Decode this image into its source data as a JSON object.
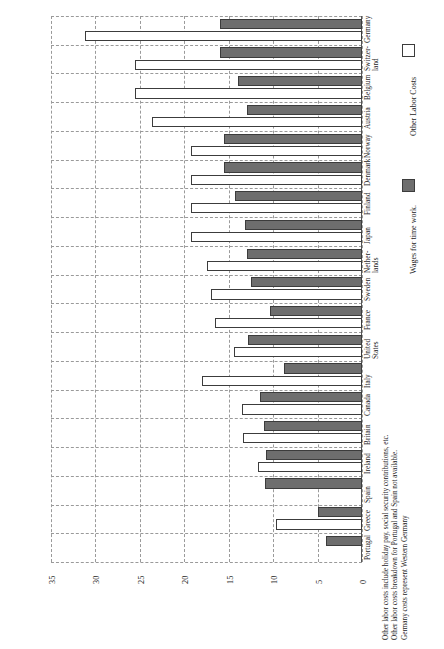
{
  "chart_data": {
    "type": "bar",
    "orientation": "horizontal",
    "title": "",
    "xlabel": "",
    "ylabel": "",
    "xlim": [
      0,
      35
    ],
    "ticks": [
      "35",
      "30",
      "25",
      "20",
      "15",
      "10",
      "5",
      "0"
    ],
    "grid": true,
    "axis_direction": "reversed",
    "legend": {
      "position": "right",
      "entries": [
        {
          "label": "Other Labor Costs",
          "swatch": "light"
        },
        {
          "label": "Wages for time work.",
          "swatch": "dark"
        }
      ]
    },
    "categories": [
      "Germany",
      "Switzer-\nland",
      "Belgium",
      "Austria",
      "Norway",
      "Denmark",
      "Finland",
      "Japan",
      "Nether-\nlands",
      "Sweden",
      "France",
      "United\nStates",
      "Italy",
      "Canada",
      "Britain",
      "Ireland",
      "Spain",
      "Greece",
      "Portugal"
    ],
    "series": [
      {
        "name": "Wages for time work.",
        "swatch": "dark",
        "values": [
          16.0,
          16.0,
          14.0,
          13.0,
          15.5,
          15.5,
          14.3,
          13.2,
          13.0,
          12.5,
          10.3,
          12.8,
          8.8,
          11.5,
          11.0,
          10.8,
          10.9,
          4.9,
          4.1
        ]
      },
      {
        "name": "Other Labor Costs",
        "swatch": "light",
        "values": [
          31.2,
          25.6,
          25.5,
          23.6,
          19.3,
          19.3,
          19.3,
          19.3,
          17.5,
          17.0,
          16.6,
          14.4,
          18.0,
          13.5,
          13.4,
          11.7,
          0.0,
          9.7,
          0.0
        ]
      }
    ],
    "footnote": [
      "Other labor costs include holiday pay, social security contributions, etc.",
      "Other labor costs breakdown for Portugal and Spain not available.",
      "Germany costs represent Western Germany"
    ]
  }
}
